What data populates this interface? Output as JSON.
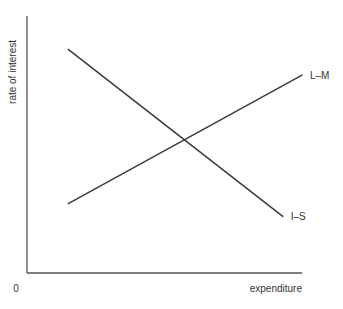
{
  "diagram": {
    "type": "IS-LM (ISLM) cross diagram",
    "axes": {
      "y_label": "rate of interest",
      "x_label": "expenditure",
      "origin_label": "0"
    },
    "curves": [
      {
        "id": "is",
        "label": "I–S",
        "slope": "downward",
        "from": [
          0.15,
          0.87
        ],
        "to": [
          0.93,
          0.22
        ]
      },
      {
        "id": "lm",
        "label": "L–M",
        "slope": "upward",
        "from": [
          0.15,
          0.27
        ],
        "to": [
          1.0,
          0.77
        ]
      }
    ],
    "colors": {
      "axis": "#555555",
      "curve": "#3a3a3a",
      "text": "#333333",
      "background": "#ffffff"
    }
  }
}
